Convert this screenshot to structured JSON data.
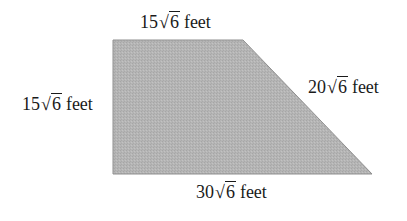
{
  "diagram": {
    "shape": "right trapezoid",
    "fill_color": "#b3b3b3",
    "edge_color": "#8a8a8a",
    "vertices": [
      [
        113,
        40
      ],
      [
        243,
        40
      ],
      [
        372,
        174
      ],
      [
        113,
        174
      ]
    ],
    "sides": {
      "top": {
        "coefficient": "15",
        "radicand": "6",
        "unit": "feet"
      },
      "left": {
        "coefficient": "15",
        "radicand": "6",
        "unit": "feet"
      },
      "slant": {
        "coefficient": "20",
        "radicand": "6",
        "unit": "feet"
      },
      "bottom": {
        "coefficient": "30",
        "radicand": "6",
        "unit": "feet"
      }
    },
    "radical_symbol": "√"
  }
}
